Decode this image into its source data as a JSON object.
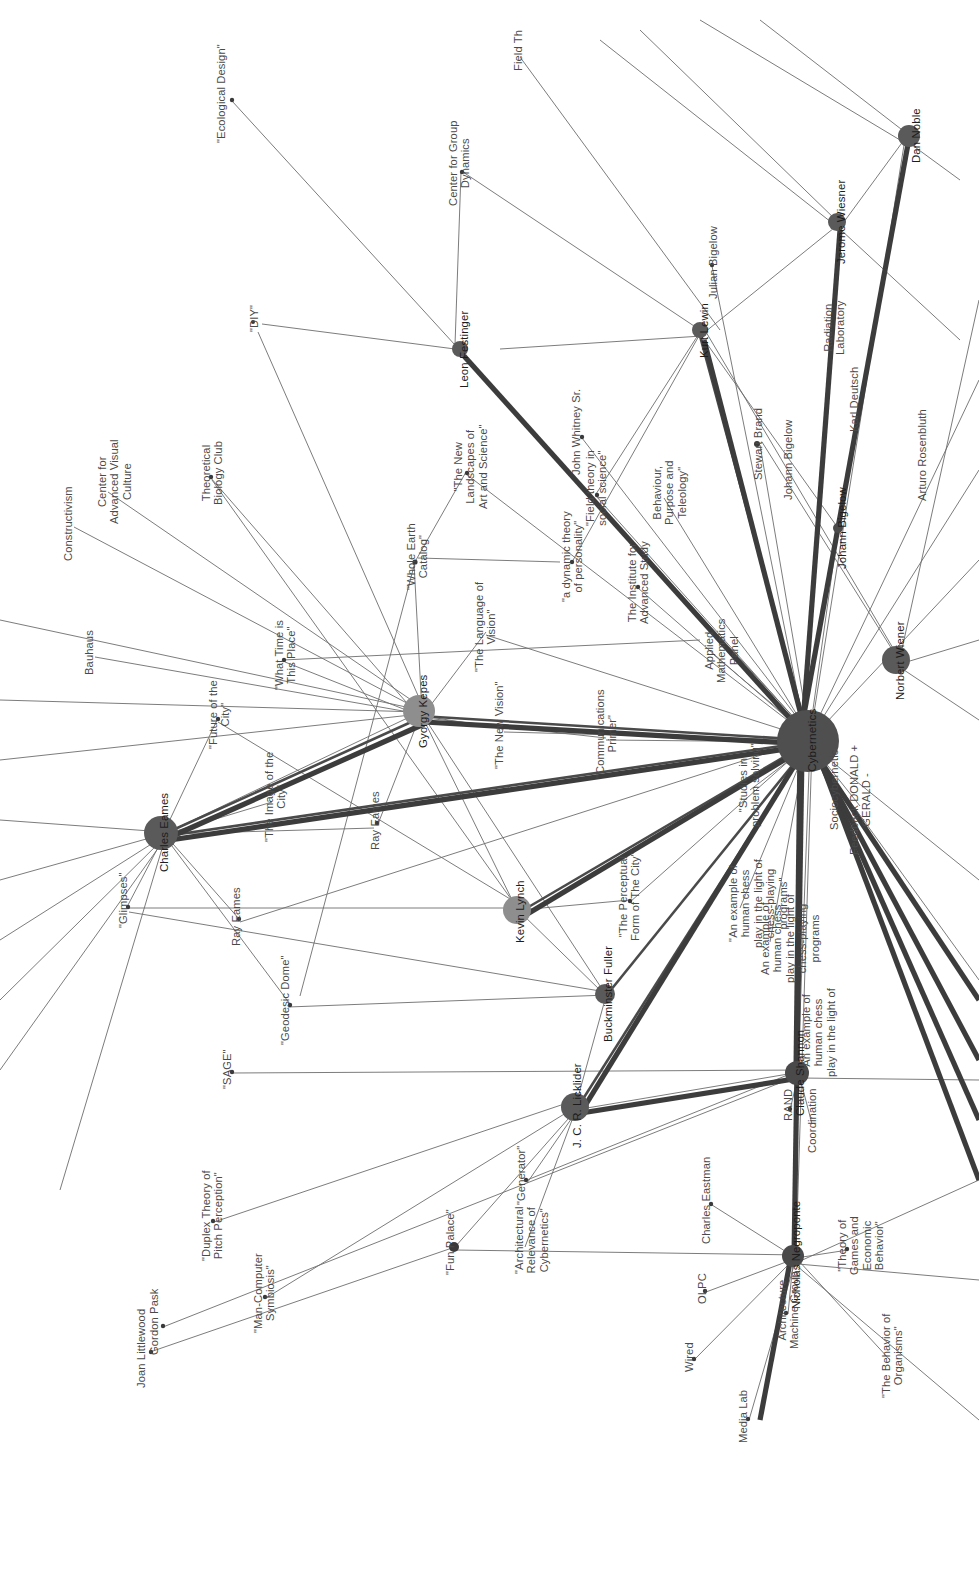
{
  "diagram": {
    "orientation": "rotated-90",
    "background": "#ffffff",
    "node_color_hub": "#4f4f4f",
    "node_color_major": "#5a5a5a",
    "node_color_mid": "#8e8e8e",
    "node_color_leaf": "#3a3a3a",
    "edge_color": "#5a5a5a"
  },
  "chart_data": {
    "type": "network-graph",
    "nodes": [
      {
        "id": "cybernetics",
        "label": "Cybernetics",
        "size": 58,
        "x": 808,
        "y": 740,
        "tier": "hub"
      },
      {
        "id": "gyorgy-kepes",
        "label": "Gyorgy Kepes",
        "size": 30,
        "x": 419,
        "y": 711,
        "tier": "major"
      },
      {
        "id": "charles-eames",
        "label": "Charles Eames",
        "size": 32,
        "x": 160,
        "y": 832,
        "tier": "major"
      },
      {
        "id": "kevin-lynch",
        "label": "Kevin Lynch",
        "size": 26,
        "x": 516,
        "y": 911,
        "tier": "mid"
      },
      {
        "id": "buckminster-fuller",
        "label": "Buckminster Fuller",
        "size": 18,
        "x": 604,
        "y": 994,
        "tier": "mid"
      },
      {
        "id": "jcr-licklider",
        "label": "J. C. R. Licklider",
        "size": 26,
        "x": 573,
        "y": 1105,
        "tier": "mid"
      },
      {
        "id": "norbert-wiener",
        "label": "Norbert Wiener",
        "size": 26,
        "x": 896,
        "y": 660,
        "tier": "mid"
      },
      {
        "id": "leon-festinger",
        "label": "Leon Festinger",
        "size": 16,
        "x": 460,
        "y": 349,
        "tier": "small"
      },
      {
        "id": "kurt-lewin",
        "label": "Kurt Lewin",
        "size": 16,
        "x": 700,
        "y": 330,
        "tier": "small"
      },
      {
        "id": "jerome-wiesner",
        "label": "Jerome Wiesner",
        "size": 17,
        "x": 837,
        "y": 222,
        "tier": "small"
      },
      {
        "id": "dan-noble",
        "label": "Dan Noble",
        "size": 20,
        "x": 912,
        "y": 135,
        "tier": "small"
      },
      {
        "id": "claude-shannon",
        "label": "Claude Shannon",
        "size": 22,
        "x": 796,
        "y": 1073,
        "tier": "mid"
      },
      {
        "id": "nicholas-negroponte",
        "label": "Nicholas Negroponte",
        "size": 20,
        "x": 792,
        "y": 1255,
        "tier": "mid"
      },
      {
        "id": "johann-bigelow",
        "label": "Johann Bigelow",
        "size": 10,
        "x": 838,
        "y": 528,
        "tier": "small"
      }
    ],
    "leaf_labels": [
      {
        "label": "\"Ecological Design\"",
        "x": 215,
        "y": 93
      },
      {
        "label": "Center for Group\nDynamics",
        "x": 447,
        "y": 163
      },
      {
        "label": "\"DIY\"",
        "x": 248,
        "y": 318
      },
      {
        "label": "Field Th",
        "x": 512,
        "y": 50
      },
      {
        "label": "Julian Bigelow",
        "x": 707,
        "y": 262
      },
      {
        "label": "Radiation\nLaboratory",
        "x": 822,
        "y": 327
      },
      {
        "label": "Karl Deutsch",
        "x": 848,
        "y": 399
      },
      {
        "label": "Arturo Rosenbluth",
        "x": 916,
        "y": 455
      },
      {
        "label": "Stewart Brand",
        "x": 752,
        "y": 444
      },
      {
        "label": "Johann Bigelow",
        "x": 782,
        "y": 460
      },
      {
        "label": "Constructivism",
        "x": 62,
        "y": 523
      },
      {
        "label": "Center for\nAdvanced Visual\nCulture",
        "x": 96,
        "y": 481
      },
      {
        "label": "Bauhaus",
        "x": 83,
        "y": 652
      },
      {
        "label": "Theoretical\nBiology Club",
        "x": 200,
        "y": 473
      },
      {
        "label": "\"What Time is\nThis Place\"",
        "x": 273,
        "y": 655
      },
      {
        "label": "\"Future of the\nCity\"",
        "x": 207,
        "y": 714
      },
      {
        "label": "\"The Image of the\nCity\"",
        "x": 263,
        "y": 797
      },
      {
        "label": "\"Glimpses\"",
        "x": 117,
        "y": 900
      },
      {
        "label": "Ray Eames",
        "x": 369,
        "y": 820
      },
      {
        "label": "Ray Eames",
        "x": 230,
        "y": 916
      },
      {
        "label": "\"Geodesic Dome\"",
        "x": 279,
        "y": 1000
      },
      {
        "label": "\"SAGE\"",
        "x": 221,
        "y": 1069
      },
      {
        "label": "\"Duplex Theory of\nPitch Perception\"",
        "x": 200,
        "y": 1215
      },
      {
        "label": "\"Man-Computer\nSymbiosis\"",
        "x": 252,
        "y": 1293
      },
      {
        "label": "Joan Littlewood",
        "x": 135,
        "y": 1348
      },
      {
        "label": "\"Fun Palace\"",
        "x": 444,
        "y": 1242
      },
      {
        "label": "Gordon Pask",
        "x": 148,
        "y": 1322
      },
      {
        "label": "\"Generator\"",
        "x": 515,
        "y": 1175
      },
      {
        "label": "\"Architectural\nRelevance of\nCybernetics\"",
        "x": 513,
        "y": 1240
      },
      {
        "label": "Charles Eastman",
        "x": 700,
        "y": 1200
      },
      {
        "label": "OLPC",
        "x": 696,
        "y": 1288
      },
      {
        "label": "Architecture\nMachine Group",
        "x": 776,
        "y": 1310
      },
      {
        "label": "Media Lab",
        "x": 737,
        "y": 1416
      },
      {
        "label": "Wired",
        "x": 683,
        "y": 1357
      },
      {
        "label": "\"Whole Earth\nCatalog\"",
        "x": 405,
        "y": 556
      },
      {
        "label": "\"The New\nLandscapes of\nArt and Science\"",
        "x": 452,
        "y": 466
      },
      {
        "label": "\"The Language of\nVision\"",
        "x": 473,
        "y": 627
      },
      {
        "label": "\"The New Vision\"",
        "x": 493,
        "y": 725
      },
      {
        "label": "\"Communications\nPrimer\"",
        "x": 594,
        "y": 733
      },
      {
        "label": "\"a dynamic theory\nof personality\"",
        "x": 560,
        "y": 556
      },
      {
        "label": "\"Field theory in\nsocial science\"",
        "x": 584,
        "y": 488
      },
      {
        "label": "John Whitney Sr.",
        "x": 570,
        "y": 432
      },
      {
        "label": "Behaviour,\nPurpose and\nTeleology\"",
        "x": 651,
        "y": 492
      },
      {
        "label": "The Institute for\nAdvanced Study",
        "x": 626,
        "y": 582
      },
      {
        "label": "Applied\nMathematics\nPanel",
        "x": 703,
        "y": 650
      },
      {
        "label": "\"The Perceptual\nForm of The City\"",
        "x": 617,
        "y": 896
      },
      {
        "label": "\"An example of\nhuman chess\nplay in the light of\nchess-playing\nprograms\"",
        "x": 727,
        "y": 903
      },
      {
        "label": "An example of\nhuman chess\nplay in the light of\nchess-playing\nprograms",
        "x": 759,
        "y": 938
      },
      {
        "label": "\"An example of\nhuman chess\nplay in the light of",
        "x": 800,
        "y": 1032
      },
      {
        "label": "RAND",
        "x": 782,
        "y": 1105
      },
      {
        "label": "Coordination",
        "x": 806,
        "y": 1120
      },
      {
        "label": "\"Studies in\nproblem solving\"",
        "x": 737,
        "y": 785
      },
      {
        "label": "Sociocybernetic",
        "x": 828,
        "y": 790
      },
      {
        "label": "Feedback DONALD +\nGERALD -",
        "x": 848,
        "y": 800
      },
      {
        "label": "\"Theory of\nGames and\nEconomic\nBehavior\"",
        "x": 836,
        "y": 1245
      },
      {
        "label": "\"The Behavior of\nOrganisms\"",
        "x": 880,
        "y": 1355
      }
    ],
    "edges": [
      {
        "from": "cybernetics",
        "to": "gyorgy-kepes",
        "weight": 6
      },
      {
        "from": "cybernetics",
        "to": "charles-eames",
        "weight": 6
      },
      {
        "from": "cybernetics",
        "to": "kevin-lynch",
        "weight": 5
      },
      {
        "from": "cybernetics",
        "to": "jcr-licklider",
        "weight": 5
      },
      {
        "from": "cybernetics",
        "to": "norbert-wiener",
        "weight": 4
      },
      {
        "from": "cybernetics",
        "to": "kurt-lewin",
        "weight": 5
      },
      {
        "from": "cybernetics",
        "to": "dan-noble",
        "weight": 6
      },
      {
        "from": "cybernetics",
        "to": "jerome-wiesner",
        "weight": 5
      },
      {
        "from": "cybernetics",
        "to": "claude-shannon",
        "weight": 5
      },
      {
        "from": "cybernetics",
        "to": "nicholas-negroponte",
        "weight": 4
      },
      {
        "from": "gyorgy-kepes",
        "to": "charles-eames",
        "weight": 4
      },
      {
        "from": "gyorgy-kepes",
        "to": "leon-festinger",
        "weight": 4
      },
      {
        "from": "kevin-lynch",
        "to": "buckminster-fuller",
        "weight": 2
      },
      {
        "from": "jcr-licklider",
        "to": "buckminster-fuller",
        "weight": 2
      }
    ]
  }
}
